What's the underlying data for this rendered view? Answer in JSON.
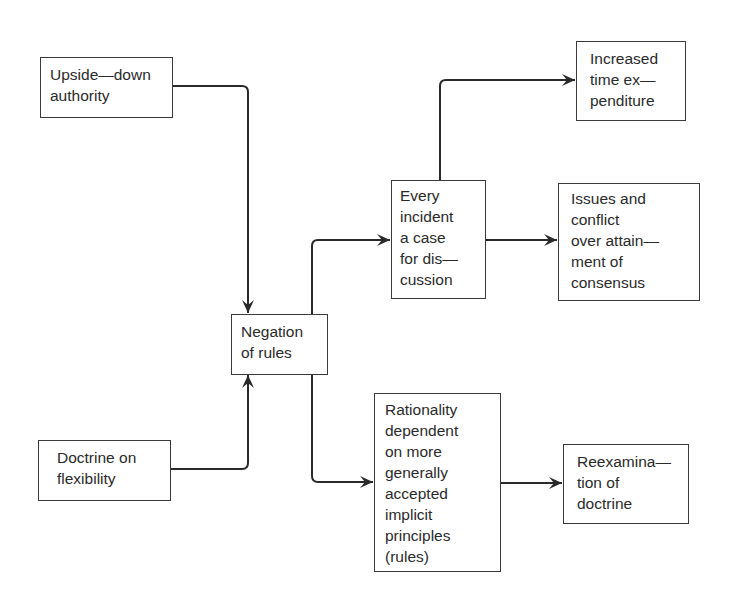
{
  "diagram": {
    "nodes": {
      "upside_down_authority": {
        "lines": [
          "Upside—down",
          "authority"
        ]
      },
      "doctrine_on_flexibility": {
        "lines": [
          "Doctrine on",
          "flexibility"
        ]
      },
      "negation_of_rules": {
        "lines": [
          "Negation",
          "of rules"
        ]
      },
      "every_incident": {
        "lines": [
          "Every",
          "incident",
          "a case",
          "for dis—",
          "cussion"
        ]
      },
      "increased_time": {
        "lines": [
          "Increased",
          "time ex—",
          "penditure"
        ]
      },
      "issues_conflict": {
        "lines": [
          "Issues and",
          "conflict",
          "over attain—",
          "ment of",
          "consensus"
        ]
      },
      "rationality": {
        "lines": [
          "Rationality",
          "dependent",
          "on more",
          "generally",
          "accepted",
          "implicit",
          "principles",
          "(rules)"
        ]
      },
      "reexamination": {
        "lines": [
          "Reexamina—",
          "tion of",
          "doctrine"
        ]
      }
    },
    "edges": [
      {
        "from": "upside_down_authority",
        "to": "negation_of_rules"
      },
      {
        "from": "doctrine_on_flexibility",
        "to": "negation_of_rules"
      },
      {
        "from": "negation_of_rules",
        "to": "every_incident"
      },
      {
        "from": "negation_of_rules",
        "to": "rationality"
      },
      {
        "from": "every_incident",
        "to": "increased_time"
      },
      {
        "from": "every_incident",
        "to": "issues_conflict"
      },
      {
        "from": "rationality",
        "to": "reexamination"
      }
    ],
    "line_color": "#2a2a2a"
  }
}
